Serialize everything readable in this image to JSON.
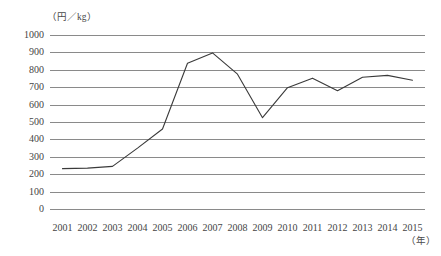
{
  "figure": {
    "title_faint": "",
    "y_axis_unit": "（円／kg）",
    "x_axis_unit": "（年）"
  },
  "chart_data": {
    "type": "line",
    "title": "",
    "subtitle": "",
    "xlabel": "（年）",
    "ylabel": "（円／kg）",
    "categories": [
      "2001",
      "2002",
      "2003",
      "2004",
      "2005",
      "2006",
      "2007",
      "2008",
      "2009",
      "2010",
      "2011",
      "2012",
      "2013",
      "2014",
      "2015"
    ],
    "values": [
      232,
      235,
      245,
      350,
      460,
      838,
      897,
      775,
      525,
      697,
      752,
      680,
      757,
      768,
      740
    ],
    "series": [
      {
        "name": "価格",
        "values": [
          232,
          235,
          245,
          350,
          460,
          838,
          897,
          775,
          525,
          697,
          752,
          680,
          757,
          768,
          740
        ]
      }
    ],
    "ylim": [
      0,
      1000
    ],
    "yticks": [
      0,
      100,
      200,
      300,
      400,
      500,
      600,
      700,
      800,
      900,
      1000
    ],
    "ytick_labels": [
      "0",
      "100",
      "200",
      "300",
      "400",
      "500",
      "600",
      "700",
      "800",
      "900",
      "1000"
    ],
    "xtick_labels": [
      "2001",
      "2002",
      "2003",
      "2004",
      "2005",
      "2006",
      "2007",
      "2008",
      "2009",
      "2010",
      "2011",
      "2012",
      "2013",
      "2014",
      "2015"
    ],
    "grid": true,
    "grid_axis": "y",
    "legend": false,
    "legend_position": "none",
    "line_color": "#3a3a3a",
    "grid_color": "#8a8a8a",
    "background_color": "#ffffff",
    "annotations": []
  }
}
